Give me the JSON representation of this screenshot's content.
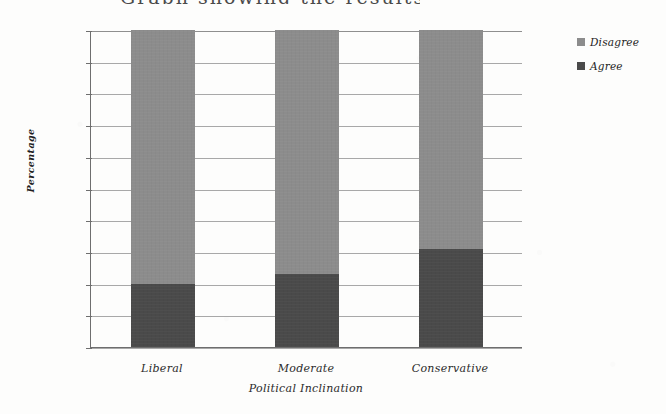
{
  "title_sliver": "Graph showing the results",
  "chart_data": {
    "type": "bar",
    "subtype": "stacked-percentage",
    "title": "",
    "xlabel": "Political Inclination",
    "ylabel": "Percentage",
    "categories": [
      "Liberal",
      "Moderate",
      "Conservative"
    ],
    "series": [
      {
        "name": "Disagree",
        "color": "#8c8c8c",
        "values": [
          80,
          77,
          69
        ]
      },
      {
        "name": "Agree",
        "color": "#4a4a4a",
        "values": [
          20,
          23,
          31
        ]
      }
    ],
    "ylim": [
      0,
      100
    ],
    "yticks": [
      0,
      10,
      20,
      30,
      40,
      50,
      60,
      70,
      80,
      90,
      100
    ],
    "ytick_labels": [
      "0%",
      "10%",
      "20%",
      "30%",
      "40%",
      "50%",
      "60%",
      "70%",
      "80%",
      "90%",
      "100%"
    ],
    "grid": true,
    "legend_position": "right"
  },
  "legend": {
    "items": [
      {
        "label": "Disagree",
        "color": "#8c8c8c"
      },
      {
        "label": "Agree",
        "color": "#4a4a4a"
      }
    ]
  }
}
